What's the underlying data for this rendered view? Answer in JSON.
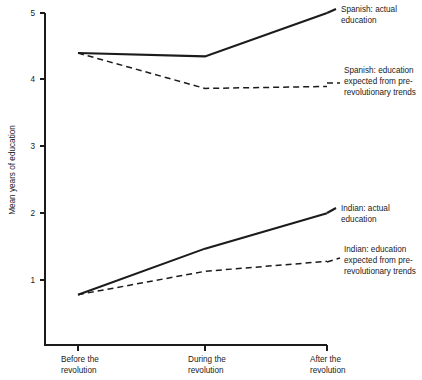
{
  "chart_data": {
    "type": "line",
    "title": "",
    "xlabel": "",
    "ylabel": "Mean years of education",
    "categories": [
      "Before the revolution",
      "During the revolution",
      "After the revolution"
    ],
    "category_lines": [
      [
        "Before the",
        "revolution"
      ],
      [
        "During the",
        "revolution"
      ],
      [
        "After the",
        "revolution"
      ]
    ],
    "ylim": [
      0.35,
      5.0
    ],
    "yticks": [
      1,
      2,
      3,
      4,
      5
    ],
    "ytick_labels": [
      "1",
      "2",
      "3",
      "4",
      "5"
    ],
    "grid": false,
    "legend_position": "inline-right-annotations",
    "series": [
      {
        "name": "Spanish: actual education",
        "style": "solid",
        "values": [
          4.4,
          4.35,
          5.0
        ],
        "label_lines": [
          "Spanish: actual",
          "education"
        ]
      },
      {
        "name": "Spanish: education expected from pre-revolutionary trends",
        "style": "dashed",
        "values": [
          4.4,
          3.87,
          3.9
        ],
        "label_lines": [
          "Spanish: education",
          "expected from pre-",
          "revolutionary trends"
        ]
      },
      {
        "name": "Indian: actual education",
        "style": "solid",
        "values": [
          0.78,
          1.47,
          2.0
        ],
        "label_lines": [
          "Indian: actual",
          "education"
        ]
      },
      {
        "name": "Indian: education expected from pre-revolutionary trends",
        "style": "dashed",
        "values": [
          0.78,
          1.13,
          1.28
        ],
        "label_lines": [
          "Indian: education",
          "expected from pre-",
          "revolutionary trends"
        ]
      }
    ]
  },
  "axes": {
    "y_axis_title": "Mean years of education",
    "y_tick_1": "1",
    "y_tick_2": "2",
    "y_tick_3": "3",
    "y_tick_4": "4",
    "y_tick_5": "5",
    "x_cat_0_line_0": "Before the",
    "x_cat_0_line_1": "revolution",
    "x_cat_1_line_0": "During the",
    "x_cat_1_line_1": "revolution",
    "x_cat_2_line_0": "After the",
    "x_cat_2_line_1": "revolution"
  },
  "annotations": {
    "spanish_actual_line_0": "Spanish: actual",
    "spanish_actual_line_1": "education",
    "spanish_expected_line_0": "Spanish: education",
    "spanish_expected_line_1": "expected from pre-",
    "spanish_expected_line_2": "revolutionary trends",
    "indian_actual_line_0": "Indian: actual",
    "indian_actual_line_1": "education",
    "indian_expected_line_0": "Indian: education",
    "indian_expected_line_1": "expected from pre-",
    "indian_expected_line_2": "revolutionary trends"
  },
  "colors": {
    "ink": "#1b1b1b",
    "background": "#ffffff"
  }
}
